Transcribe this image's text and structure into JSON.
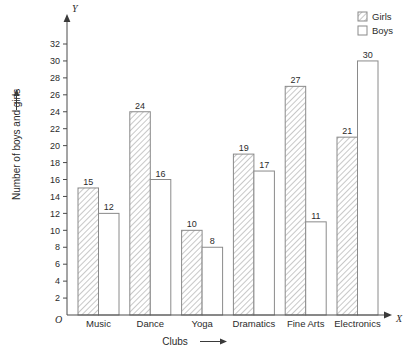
{
  "chart_data": {
    "type": "bar",
    "title": "",
    "subtitle": "",
    "xlabel": "Clubs",
    "ylabel": "Number of boys and girls",
    "x_axis_name": "X",
    "y_axis_name": "Y",
    "origin_label": "O",
    "categories": [
      "Music",
      "Dance",
      "Yoga",
      "Dramatics",
      "Fine Arts",
      "Electronics"
    ],
    "series": [
      {
        "name": "Girls",
        "fill": "hatched",
        "color": "#9a9a9a",
        "values": [
          15,
          24,
          10,
          19,
          27,
          21
        ]
      },
      {
        "name": "Boys",
        "fill": "white",
        "color": "#ffffff",
        "values": [
          12,
          16,
          8,
          17,
          11,
          30
        ]
      }
    ],
    "ylim": [
      0,
      33
    ],
    "yticks": [
      2,
      4,
      6,
      8,
      10,
      12,
      14,
      16,
      18,
      20,
      22,
      24,
      26,
      28,
      30,
      32
    ],
    "ytick_labels": [
      "2",
      "4",
      "6",
      "8",
      "10",
      "12",
      "14",
      "16",
      "18",
      "20",
      "22",
      "24",
      "26",
      "28",
      "30",
      "32"
    ],
    "grid": false,
    "legend_position": "top-right",
    "data_labels": true,
    "axis_arrows": true
  },
  "legend": {
    "items": [
      {
        "label": "Girls",
        "swatch": "hatched-swatch"
      },
      {
        "label": "Boys",
        "swatch": "white-swatch"
      }
    ]
  },
  "axes": {
    "y_arrow_glyph": "⟶",
    "x_arrow_glyph": "⟶"
  }
}
